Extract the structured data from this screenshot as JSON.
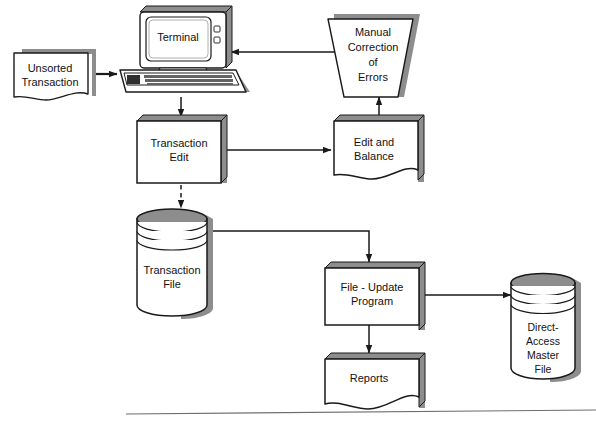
{
  "diagram": {
    "style": {
      "line_color": "#1a1a1a",
      "shadow_color": "#8d8d8d",
      "fill_color": "#ffffff",
      "text_color": "#111111",
      "background": "#ffffff"
    },
    "nodes": {
      "unsorted_transaction": {
        "label_line1": "Unsorted",
        "label_line2": "Transaction",
        "shape": "document"
      },
      "terminal": {
        "label": "Terminal",
        "shape": "terminal-crt"
      },
      "manual_correction": {
        "label_line1": "Manual",
        "label_line2": "Correction",
        "label_line3": "of",
        "label_line4": "Errors",
        "shape": "manual-operation-trapezoid"
      },
      "transaction_edit": {
        "label_line1": "Transaction",
        "label_line2": "Edit",
        "shape": "process"
      },
      "edit_and_balance": {
        "label_line1": "Edit and",
        "label_line2": "Balance",
        "shape": "document"
      },
      "transaction_file": {
        "label_line1": "Transaction",
        "label_line2": "File",
        "shape": "cylinder-disk"
      },
      "file_update_program": {
        "label_line1": "File - Update",
        "label_line2": "Program",
        "shape": "process"
      },
      "direct_access_master_file": {
        "label_line1": "Direct-",
        "label_line2": "Access",
        "label_line3": "Master",
        "label_line4": "File",
        "shape": "cylinder-disk"
      },
      "reports": {
        "label": "Reports",
        "shape": "document"
      }
    },
    "connectors": [
      {
        "name": "unsorted-to-terminal",
        "from": "unsorted_transaction",
        "to": "terminal",
        "style": "solid",
        "arrow": "end"
      },
      {
        "name": "manual-correction-to-terminal",
        "from": "manual_correction",
        "to": "terminal",
        "style": "solid",
        "arrow": "end"
      },
      {
        "name": "terminal-to-transaction-edit",
        "from": "terminal",
        "to": "transaction_edit",
        "style": "solid",
        "arrow": "end"
      },
      {
        "name": "transaction-edit-to-edit-and-balance",
        "from": "transaction_edit",
        "to": "edit_and_balance",
        "style": "solid",
        "arrow": "end"
      },
      {
        "name": "edit-and-balance-to-manual-correction",
        "from": "edit_and_balance",
        "to": "manual_correction",
        "style": "solid",
        "arrow": "end"
      },
      {
        "name": "transaction-edit-to-transaction-file",
        "from": "transaction_edit",
        "to": "transaction_file",
        "style": "dashed",
        "arrow": "end"
      },
      {
        "name": "transaction-file-to-file-update-program",
        "from": "transaction_file",
        "to": "file_update_program",
        "style": "solid",
        "arrow": "end"
      },
      {
        "name": "file-update-program-to-master-file",
        "from": "file_update_program",
        "to": "direct_access_master_file",
        "style": "solid",
        "arrow": "both"
      },
      {
        "name": "file-update-program-to-reports",
        "from": "file_update_program",
        "to": "reports",
        "style": "solid",
        "arrow": "end"
      }
    ],
    "footer_rule": {
      "name": "bottom-divider",
      "visible": true
    }
  }
}
